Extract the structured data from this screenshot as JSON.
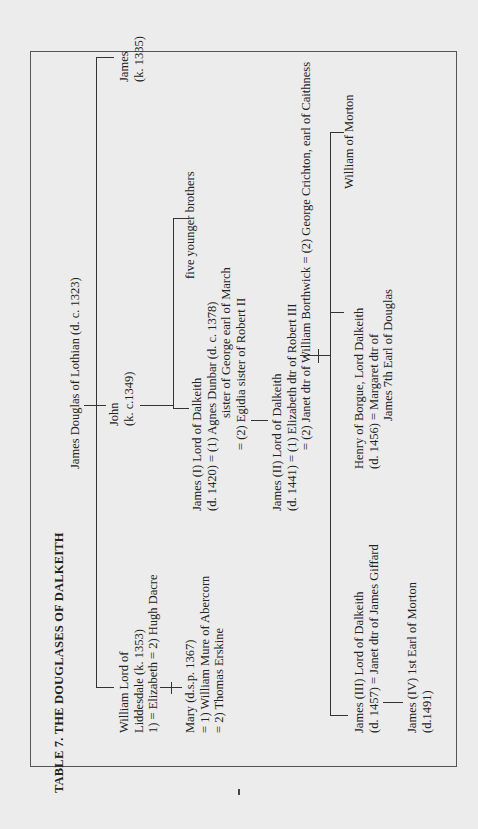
{
  "title": "TABLE 7.  THE DOUGLASES OF DALKEITH",
  "root": "James Douglas of Lothian (d. c. 1323)",
  "gen1": {
    "william": [
      "William Lord of",
      "Liddesdale (k. 1353)",
      "1) = Elizabeth = 2) Hugh Dacre"
    ],
    "john": [
      "John",
      "(k. c.1349)"
    ],
    "james": [
      "James",
      "(k. 1335)"
    ]
  },
  "gen2": {
    "mary": [
      "Mary (d.s.p. 1367)",
      "= 1) William Mure of Abercorn",
      "= 2) Thomas Erskine"
    ],
    "james1": [
      "James (I) Lord of Dalkeith",
      "(d. 1420) = (1) Agnes Dunbar (d. c. 1378)",
      "sister of George earl of March",
      "= (2) Egidia sister of Robert II"
    ],
    "brothers": "five younger brothers"
  },
  "gen3": {
    "james2": [
      "James (II) Lord of Dalkeith",
      "(d. 1441) = (1) Elizabeth dtr of Robert III",
      "= (2) Janet dtr of William Borthwick = (2) George Crichton, earl of Caithness"
    ]
  },
  "gen4": {
    "james3": [
      "James (III) Lord of Dalkeith",
      "(d. 1457) = Janet dtr of James Giffard"
    ],
    "henry": [
      "Henry of Borgue, Lord Dalkeith",
      "(d. 1456) = Margaret dtr of",
      "James 7th Earl of Douglas"
    ],
    "william_morton": "William of Morton"
  },
  "gen5": {
    "james4": [
      "James (IV) 1st Earl of Morton",
      "(d.1491)"
    ]
  }
}
